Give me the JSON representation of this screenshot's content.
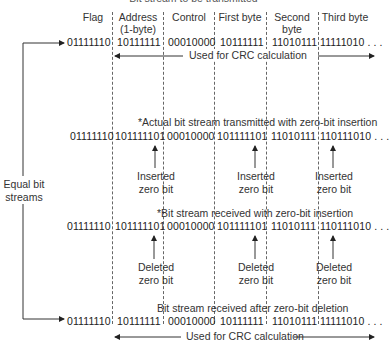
{
  "title": "Bit stream to be transmitted",
  "headers": [
    "Flag",
    "Address\n(1-byte)",
    "Control",
    "First byte",
    "Second\nbyte",
    "Third byte"
  ],
  "header_lines": {
    "flag": "Flag",
    "address": [
      "Address",
      "(1-byte)"
    ],
    "control": "Control",
    "first": "First byte",
    "second": [
      "Second",
      "byte"
    ],
    "third": "Third byte"
  },
  "rows": {
    "original": {
      "caption": "",
      "bits": [
        "01111110",
        "10111111",
        "00010000",
        "10111111",
        "11010111",
        "11111010 . . ."
      ]
    },
    "transmitted": {
      "caption": "*Actual bit stream transmitted with zero-bit insertion",
      "bits": [
        "01111110",
        "101111101",
        "00010000",
        "101111101",
        "11010111",
        "110111010 . . ."
      ]
    },
    "received": {
      "caption": "*Bit stream received with zero-bit insertion",
      "bits": [
        "01111110",
        "101111101",
        "00010000",
        "101111101",
        "11010111",
        "110111010 . . ."
      ]
    },
    "after_deletion": {
      "caption": "Bit stream received after zero-bit deletion",
      "bits": [
        "01111110",
        "10111111",
        "00010000",
        "10111111",
        "11010111",
        "11111010 . . ."
      ]
    }
  },
  "crc_label": "Used for CRC calculation",
  "inserted_label": [
    "Inserted",
    "zero bit"
  ],
  "deleted_label": [
    "Deleted",
    "zero bit"
  ],
  "equal_label": [
    "Equal bit",
    "streams"
  ]
}
